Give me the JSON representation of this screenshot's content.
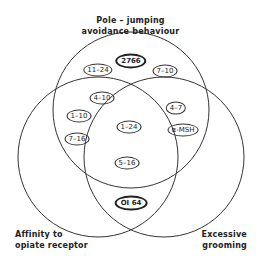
{
  "sets": {
    "top": {
      "label_line1": "Pole – jumping",
      "label_line2": "avoidance behaviour"
    },
    "left": {
      "label_line1": "Affinity to",
      "label_line2": "opiate receptor"
    },
    "right": {
      "label_line1": "Excessive",
      "label_line2": "grooming"
    }
  },
  "items": {
    "top_only_center": "2766",
    "top_only_left": "11–24",
    "top_only_right": "7–10",
    "top_left_a": "4–10",
    "top_left_b": "1–10",
    "top_left_c": "7–16",
    "top_right_a": "4–7",
    "top_right_b": "α-MSH",
    "all_three_a": "1–24",
    "all_three_b": "5–16",
    "left_right_only": "OI 64"
  },
  "colors": {
    "stroke": "#333333",
    "text": "#222222",
    "background": "#ffffff"
  }
}
